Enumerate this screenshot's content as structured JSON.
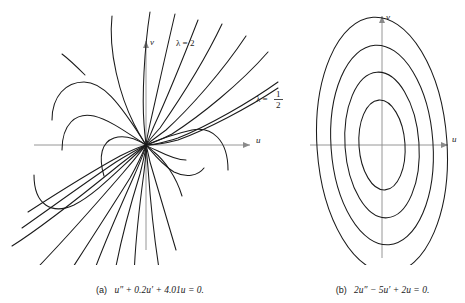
{
  "figure": {
    "background_color": "#ffffff",
    "ink_color": "#1a1a1a",
    "axis_color": "#8a8a8a"
  },
  "panels": [
    {
      "id": "a",
      "tag": "(a)",
      "equation": "u″ + 0.2u′ + 4.01u = 0.",
      "axis_x_label": "u",
      "axis_y_label": "v",
      "annotations": [
        {
          "name": "lambda-2",
          "text": "λ = 2",
          "x": 176,
          "y": 46
        },
        {
          "name": "lambda-half-lhs",
          "text": "λ =",
          "x": 256,
          "y": 99
        },
        {
          "name": "lambda-half-numerator",
          "text": "1",
          "x": 278,
          "y": 94
        },
        {
          "name": "lambda-half-denominator",
          "text": "2",
          "x": 278,
          "y": 105
        }
      ]
    },
    {
      "id": "b",
      "tag": "(b)",
      "equation": "2u″ − 5u′ + 2u = 0.",
      "axis_x_label": "u",
      "axis_y_label": "v",
      "annotations": []
    }
  ],
  "chart_data": [
    {
      "type": "line",
      "title": "(a)  u'' + 0.2u' + 4.01u = 0.",
      "subtitle": "Phase portrait: stable spiral/node trajectories converging to origin",
      "xlabel": "u",
      "ylabel": "v",
      "grid": false,
      "legend": [
        "lambda = 2",
        "lambda = 1/2"
      ],
      "legend_position": "in-plot annotations",
      "origin_px": [
        146,
        145
      ],
      "xlim": [
        -3,
        3
      ],
      "ylim": [
        -3,
        3
      ],
      "eigen_directions": [
        {
          "label": "lambda = 2",
          "slope": 2.0
        },
        {
          "label": "lambda = 1/2",
          "slope": 0.5
        }
      ],
      "series": [
        {
          "name": "traj-1",
          "path": "M 34 175 C 34 205, 52 215, 74 205 C 96 194, 118 170, 146 145"
        },
        {
          "name": "traj-2",
          "path": "M 52 120 C 52 96, 66 82, 84 82 C 102 82, 118 100, 146 145"
        },
        {
          "name": "traj-3",
          "path": "M 12 246 C 44 226, 86 192, 118 166 C 132 155, 140 149, 146 145"
        },
        {
          "name": "traj-4",
          "path": "M 40 265 C 64 240, 96 204, 122 174 C 136 158, 142 150, 146 145"
        },
        {
          "name": "traj-5",
          "path": "M 62 150 C 62 124, 76 112, 94 116 C 110 120, 126 132, 146 145"
        },
        {
          "name": "traj-6",
          "path": "M 64 281 C 84 250, 110 210, 130 178 C 140 160, 144 150, 146 145"
        },
        {
          "name": "traj-7",
          "path": "M 88 288 C 100 252, 120 208, 134 176 C 142 158, 145 150, 146 145"
        },
        {
          "name": "traj-8",
          "path": "M 104 176 C 98 156, 102 142, 114 138 C 126 134, 138 140, 146 145"
        },
        {
          "name": "traj-9",
          "path": "M 112 289 C 118 250, 130 206, 140 174 C 144 158, 146 150, 146 145"
        },
        {
          "name": "traj-10",
          "path": "M 134 285 C 134 246, 140 202, 144 172 C 146 158, 146 150, 146 145"
        },
        {
          "name": "traj-11",
          "path": "M 160 275 C 154 238, 150 196, 148 168 C 147 155, 146 149, 146 145"
        },
        {
          "name": "traj-12",
          "path": "M 176 250 C 166 216, 156 182, 150 162 C 148 153, 147 148, 146 145"
        },
        {
          "name": "traj-13",
          "path": "M 182 196 C 176 176, 164 160, 154 152 C 150 148, 147 146, 146 145"
        },
        {
          "name": "traj-14",
          "path": "M 186 160 C 180 160, 168 156, 158 151 C 151 148, 147 146, 146 145"
        },
        {
          "name": "traj-15",
          "path": "M 204 168 C 198 176, 186 178, 174 172 C 162 165, 152 152, 146 145"
        },
        {
          "name": "traj-16",
          "path": "M 228 170 C 228 140, 212 126, 192 130 C 174 134, 158 140, 146 145"
        },
        {
          "name": "traj-17",
          "path": "M 112 16 C 108 52, 120 96, 134 124 C 141 138, 145 143, 146 145"
        },
        {
          "name": "traj-18",
          "path": "M 150 12 C 144 50, 142 98, 144 124 C 145 138, 146 143, 146 145"
        },
        {
          "name": "traj-19",
          "path": "M 175 14 C 166 52, 156 98, 150 124 C 147 138, 146 143, 146 145"
        },
        {
          "name": "traj-20",
          "path": "M 198 20 C 184 56, 166 100, 154 126 C 149 138, 147 143, 146 145"
        },
        {
          "name": "traj-21",
          "path": "M 222 24 C 204 62, 178 102, 160 128 C 151 138, 147 143, 146 145"
        },
        {
          "name": "traj-22",
          "path": "M 246 36 C 222 72, 190 108, 166 130 C 154 139, 148 143, 146 145"
        },
        {
          "name": "traj-23",
          "path": "M 268 52 C 240 84, 200 116, 172 134 C 156 142, 149 144, 146 145"
        },
        {
          "name": "traj-24",
          "path": "M 278 82 C 250 102, 208 126, 178 138 C 159 144, 150 145, 146 145"
        },
        {
          "name": "traj-25",
          "path": "M 278 88 C 248 108, 206 130, 178 140 C 159 145, 150 145, 146 145"
        },
        {
          "name": "traj-26",
          "path": "M 146 145 C 142 146, 134 149, 120 156 C 98 168, 62 190, 28 212"
        },
        {
          "name": "traj-27",
          "path": "M 146 145 C 142 147, 132 152, 116 162 C 92 178, 56 204, 22 228"
        },
        {
          "name": "traj-28",
          "path": "M 85 75 C 76 66, 70 60, 62 54"
        }
      ]
    },
    {
      "type": "line",
      "title": "(b)  2u'' - 5u' + 2u = 0.",
      "subtitle": "Phase portrait: closed elliptic orbits (center)",
      "xlabel": "u",
      "ylabel": "v",
      "grid": false,
      "legend": [],
      "legend_position": "none",
      "origin_px": [
        82,
        145
      ],
      "xlim": [
        -3,
        3
      ],
      "ylim": [
        -3,
        3
      ],
      "ellipses": [
        {
          "name": "orbit-1",
          "rx": 23,
          "ry": 45,
          "rotation_deg": -4
        },
        {
          "name": "orbit-2",
          "rx": 37,
          "ry": 73,
          "rotation_deg": -4
        },
        {
          "name": "orbit-3",
          "rx": 51,
          "ry": 100,
          "rotation_deg": -4
        },
        {
          "name": "orbit-4",
          "rx": 65,
          "ry": 128,
          "rotation_deg": -4
        }
      ]
    }
  ]
}
